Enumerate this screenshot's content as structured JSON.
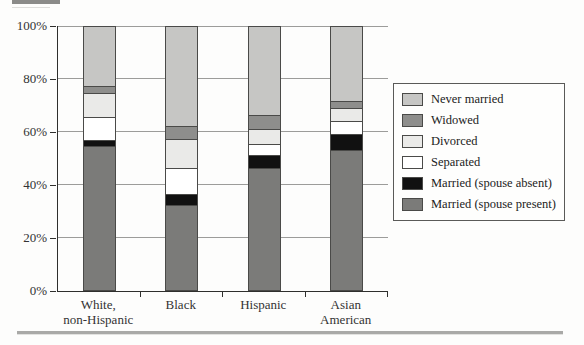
{
  "colors": {
    "axis": "#2f2f2d",
    "gridline": "#9c9c9a",
    "segment_border": "#4a4a48",
    "legend_border": "#5a5a58",
    "background": "#fdfdfc",
    "top_rule": "#8b8b89",
    "bottom_rule": "#a9a9a7"
  },
  "y_axis": {
    "ticks": [
      {
        "label": "100%",
        "value": 100
      },
      {
        "label": "80%",
        "value": 80
      },
      {
        "label": "60%",
        "value": 60
      },
      {
        "label": "40%",
        "value": 40
      },
      {
        "label": "20%",
        "value": 20
      },
      {
        "label": "0%",
        "value": 0
      }
    ]
  },
  "x_axis": {
    "category_lines": [
      [
        "White,",
        "non-Hispanic"
      ],
      [
        "Black"
      ],
      [
        "Hispanic"
      ],
      [
        "Asian",
        "American"
      ]
    ]
  },
  "chart_data": {
    "type": "bar",
    "subtype": "stacked-100-percent",
    "title": "",
    "xlabel": "",
    "ylabel": "",
    "ylim": [
      0,
      100
    ],
    "grid": true,
    "legend_position": "right",
    "categories": [
      "White, non-Hispanic",
      "Black",
      "Hispanic",
      "Asian American"
    ],
    "series": [
      {
        "name": "Never married",
        "color": "#c6c6c4",
        "values": [
          23,
          38,
          34,
          28.5
        ]
      },
      {
        "name": "Widowed",
        "color": "#8e8e8c",
        "values": [
          2.5,
          5,
          5,
          2.5
        ]
      },
      {
        "name": "Divorced",
        "color": "#eaeae8",
        "values": [
          9,
          11,
          6,
          5
        ]
      },
      {
        "name": "Separated",
        "color": "#ffffff",
        "values": [
          9,
          10,
          4,
          5
        ]
      },
      {
        "name": "Married (spouse absent)",
        "color": "#111111",
        "values": [
          2,
          4,
          5,
          6
        ]
      },
      {
        "name": "Married (spouse present)",
        "color": "#7b7b79",
        "values": [
          54.5,
          32,
          46,
          53
        ]
      }
    ]
  }
}
